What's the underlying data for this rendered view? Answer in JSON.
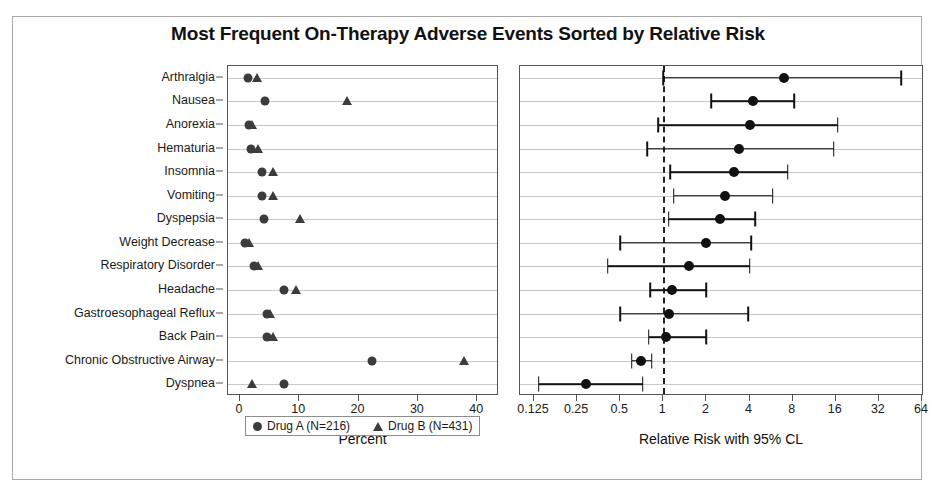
{
  "chart_data": {
    "type": "scatter",
    "title": "Most Frequent On-Therapy Adverse Events Sorted by Relative Risk",
    "categories": [
      "Arthralgia",
      "Nausea",
      "Anorexia",
      "Hematuria",
      "Insomnia",
      "Vomiting",
      "Dyspepsia",
      "Weight Decrease",
      "Respiratory Disorder",
      "Headache",
      "Gastroesophageal Reflux",
      "Back Pain",
      "Chronic Obstructive Airway",
      "Dyspnea"
    ],
    "panels": [
      {
        "name": "percent-panel",
        "xlabel": "Percent",
        "xlim": [
          0,
          42
        ],
        "ticks": [
          0,
          10,
          20,
          30,
          40
        ],
        "tick_labels": [
          "0",
          "10",
          "20",
          "30",
          "40"
        ],
        "grid": true,
        "series": [
          {
            "name": "Drug A (N=216)",
            "marker": "circle",
            "values": [
              1.4,
              4.3,
              1.6,
              1.8,
              3.7,
              3.7,
              4.1,
              0.9,
              2.3,
              7.4,
              4.6,
              4.6,
              22.2,
              7.4
            ]
          },
          {
            "name": "Drug B (N=431)",
            "marker": "triangle",
            "values": [
              2.8,
              18.1,
              2.1,
              3.0,
              5.6,
              5.6,
              10.2,
              1.6,
              3.0,
              9.5,
              5.1,
              5.6,
              37.8,
              2.1
            ]
          }
        ]
      },
      {
        "name": "relative-risk-panel",
        "xlabel": "Relative Risk with 95% CL",
        "scale": "log2",
        "xlim": [
          0.125,
          64
        ],
        "ticks": [
          0.125,
          0.25,
          0.5,
          1,
          2,
          4,
          8,
          16,
          32,
          64
        ],
        "tick_labels": [
          "0.125",
          "0.25",
          "0.5",
          "1",
          "2",
          "4",
          "8",
          "16",
          "32",
          "64"
        ],
        "reference_line": 1,
        "grid": true,
        "estimates": [
          {
            "category": "Arthralgia",
            "rr": 7.0,
            "lcl": 1.0,
            "ucl": 46.0
          },
          {
            "category": "Nausea",
            "rr": 4.2,
            "lcl": 2.15,
            "ucl": 8.2
          },
          {
            "category": "Anorexia",
            "rr": 4.0,
            "lcl": 0.92,
            "ucl": 16.5
          },
          {
            "category": "Hematuria",
            "rr": 3.4,
            "lcl": 0.77,
            "ucl": 15.5
          },
          {
            "category": "Insomnia",
            "rr": 3.1,
            "lcl": 1.12,
            "ucl": 7.4
          },
          {
            "category": "Vomiting",
            "rr": 2.7,
            "lcl": 1.18,
            "ucl": 5.8
          },
          {
            "category": "Dyspepsia",
            "rr": 2.5,
            "lcl": 1.09,
            "ucl": 4.4
          },
          {
            "category": "Weight Decrease",
            "rr": 2.0,
            "lcl": 0.5,
            "ucl": 4.1
          },
          {
            "category": "Respiratory Disorder",
            "rr": 1.5,
            "lcl": 0.41,
            "ucl": 4.0
          },
          {
            "category": "Headache",
            "rr": 1.15,
            "lcl": 0.81,
            "ucl": 2.0
          },
          {
            "category": "Gastroesophageal Reflux",
            "rr": 1.1,
            "lcl": 0.5,
            "ucl": 3.9
          },
          {
            "category": "Back Pain",
            "rr": 1.05,
            "lcl": 0.79,
            "ucl": 2.0
          },
          {
            "category": "Chronic Obstructive Airway",
            "rr": 0.7,
            "lcl": 0.6,
            "ucl": 0.83
          },
          {
            "category": "Dyspnea",
            "rr": 0.29,
            "lcl": 0.135,
            "ucl": 0.72
          }
        ]
      }
    ]
  },
  "legend": {
    "items": [
      {
        "marker": "circle",
        "label": "Drug A (N=216)"
      },
      {
        "marker": "triangle",
        "label": "Drug B (N=431)"
      }
    ]
  }
}
